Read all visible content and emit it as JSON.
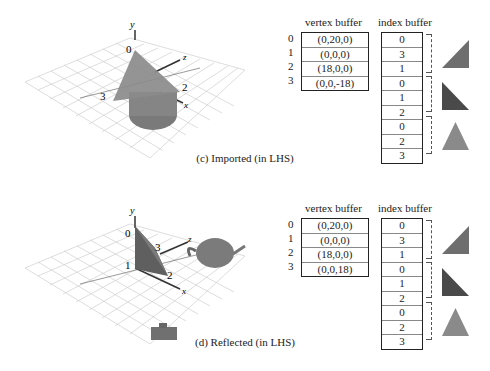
{
  "panels": [
    {
      "id": "c",
      "caption": "(c) Imported (in LHS)",
      "scene": {
        "axes": {
          "y": "y",
          "x": "x",
          "z": "z"
        },
        "vertex_labels": [
          "0",
          "2",
          "3"
        ],
        "object": "cone"
      },
      "vertex_buffer": {
        "title": "vertex buffer",
        "indices": [
          "0",
          "1",
          "2",
          "3"
        ],
        "values": [
          "(0,20,0)",
          "(0,0,0)",
          "(18,0,0)",
          "(0,0,-18)"
        ]
      },
      "index_buffer": {
        "title": "index buffer",
        "values": [
          "0",
          "3",
          "1",
          "0",
          "1",
          "2",
          "0",
          "2",
          "3"
        ]
      },
      "triangles": [
        {
          "shape": "right-triangle-up",
          "color": "#6e6e6e"
        },
        {
          "shape": "right-triangle-down",
          "color": "#4a4a4a"
        },
        {
          "shape": "isosceles",
          "color": "#8a8a8a"
        }
      ]
    },
    {
      "id": "d",
      "caption": "(d) Reflected (in LHS)",
      "scene": {
        "axes": {
          "y": "y",
          "x": "x",
          "z": "z"
        },
        "vertex_labels": [
          "0",
          "1",
          "2",
          "3"
        ],
        "object": "teapot"
      },
      "vertex_buffer": {
        "title": "vertex buffer",
        "indices": [
          "0",
          "1",
          "2",
          "3"
        ],
        "values": [
          "(0,20,0)",
          "(0,0,0)",
          "(18,0,0)",
          "(0,0,18)"
        ]
      },
      "index_buffer": {
        "title": "index buffer",
        "values": [
          "0",
          "3",
          "1",
          "0",
          "1",
          "2",
          "0",
          "2",
          "3"
        ]
      },
      "triangles": [
        {
          "shape": "right-triangle-up",
          "color": "#6e6e6e"
        },
        {
          "shape": "right-triangle-down",
          "color": "#4a4a4a"
        },
        {
          "shape": "isosceles",
          "color": "#8a8a8a"
        }
      ]
    }
  ]
}
